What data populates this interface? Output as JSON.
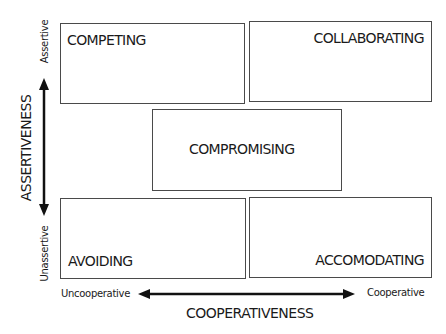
{
  "diagram": {
    "boxes": {
      "competing": "COMPETING",
      "collaborating": "COLLABORATING",
      "compromising": "COMPROMISING",
      "avoiding": "AVOIDING",
      "accomodating": "ACCOMODATING"
    },
    "y_axis": {
      "title": "ASSERTIVENESS",
      "top_label": "Assertive",
      "bottom_label": "Unassertive"
    },
    "x_axis": {
      "title": "COOPERATIVENESS",
      "left_label": "Uncooperative",
      "right_label": "Cooperative"
    },
    "colors": {
      "line": "#111111",
      "box_border": "#4a4a4a",
      "text": "#1a1a1a"
    }
  }
}
